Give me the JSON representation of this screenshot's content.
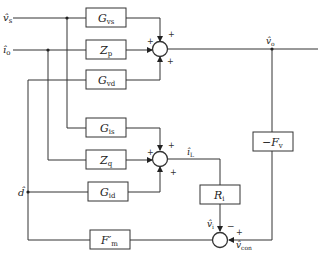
{
  "diagram": {
    "type": "block-diagram",
    "inputs": {
      "vs": {
        "main": "v̂",
        "sub": "s"
      },
      "io": {
        "main": "î",
        "sub": "o"
      },
      "d": {
        "main": "d̂",
        "sub": ""
      }
    },
    "blocks": {
      "gvs": {
        "main": "G",
        "sub": "vs"
      },
      "zp": {
        "main": "Z",
        "sub": "p"
      },
      "gvd": {
        "main": "G",
        "sub": "vd"
      },
      "gis": {
        "main": "G",
        "sub": "is"
      },
      "zq": {
        "main": "Z",
        "sub": "q"
      },
      "gid": {
        "main": "G",
        "sub": "id"
      },
      "fm": {
        "main": "F′",
        "sub": "m"
      },
      "ri": {
        "main": "R",
        "sub": "i"
      },
      "fv": {
        "main": "−F",
        "sub": "v"
      }
    },
    "signals": {
      "vo": {
        "main": "v̂",
        "sub": "o"
      },
      "il": {
        "main": "î",
        "sub": "L"
      },
      "vi": {
        "main": "v̂",
        "sub": "i"
      },
      "vcon": {
        "main": "v̂",
        "sub": "con"
      }
    },
    "signs": {
      "plus": "+",
      "minus": "−"
    }
  }
}
